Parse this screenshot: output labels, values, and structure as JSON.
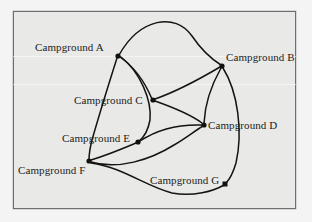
{
  "figure": {
    "type": "undirected-graph",
    "background_color": "#e9e9e7",
    "border_color": "#6e6e6e",
    "edge_color": "#141414",
    "node_color": "#111111",
    "nodes": [
      {
        "id": "A",
        "label": "Campground A",
        "x": 118,
        "y": 56,
        "shape": "dot",
        "label_x": 35,
        "label_y": 42
      },
      {
        "id": "B",
        "label": "Campground B",
        "x": 222,
        "y": 66,
        "shape": "dot",
        "label_x": 226,
        "label_y": 52
      },
      {
        "id": "C",
        "label": "Campground C",
        "x": 153,
        "y": 100,
        "shape": "dot",
        "label_x": 74,
        "label_y": 95
      },
      {
        "id": "D",
        "label": "Campground D",
        "x": 204,
        "y": 125,
        "shape": "dot",
        "label_x": 208,
        "label_y": 120
      },
      {
        "id": "E",
        "label": "Campground E",
        "x": 138,
        "y": 142,
        "shape": "dot",
        "label_x": 62,
        "label_y": 133
      },
      {
        "id": "F",
        "label": "Campground F",
        "x": 89,
        "y": 161,
        "shape": "dot",
        "label_x": 18,
        "label_y": 165
      },
      {
        "id": "G",
        "label": "Campground G",
        "x": 225,
        "y": 184,
        "shape": "square",
        "label_x": 150,
        "label_y": 175
      }
    ],
    "edges": [
      {
        "from": "A",
        "to": "B",
        "style": "curve-above"
      },
      {
        "from": "A",
        "to": "C",
        "style": "curve-right"
      },
      {
        "from": "A",
        "to": "F",
        "style": "curve-left"
      },
      {
        "from": "A",
        "to": "E",
        "style": "curve-down"
      },
      {
        "from": "C",
        "to": "B",
        "style": "curve-up"
      },
      {
        "from": "C",
        "to": "D",
        "style": "curve-down"
      },
      {
        "from": "B",
        "to": "D",
        "style": "curve-left"
      },
      {
        "from": "B",
        "to": "G",
        "style": "curve-right"
      },
      {
        "from": "E",
        "to": "D",
        "style": "curve-up"
      },
      {
        "from": "E",
        "to": "F",
        "style": "straight"
      },
      {
        "from": "F",
        "to": "D",
        "style": "curve-below"
      },
      {
        "from": "F",
        "to": "G",
        "style": "curve-below"
      }
    ]
  }
}
